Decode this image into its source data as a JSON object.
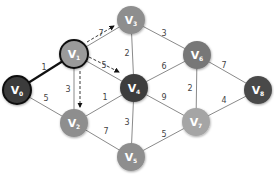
{
  "graph": {
    "nodes": [
      {
        "id": "V0",
        "label": "V",
        "sub": "0",
        "x": 17,
        "y": 90,
        "color": "#3a3a3a",
        "highlight": true
      },
      {
        "id": "V1",
        "label": "V",
        "sub": "1",
        "x": 74,
        "y": 54,
        "color": "#9a9a9a",
        "highlight": true
      },
      {
        "id": "V2",
        "label": "V",
        "sub": "2",
        "x": 74,
        "y": 123,
        "color": "#8e8e8e",
        "highlight": false
      },
      {
        "id": "V3",
        "label": "V",
        "sub": "3",
        "x": 131,
        "y": 20,
        "color": "#8e8e8e",
        "highlight": false
      },
      {
        "id": "V4",
        "label": "V",
        "sub": "4",
        "x": 134,
        "y": 88,
        "color": "#3e3e3e",
        "highlight": false
      },
      {
        "id": "V5",
        "label": "V",
        "sub": "5",
        "x": 131,
        "y": 157,
        "color": "#8e8e8e",
        "highlight": false
      },
      {
        "id": "V6",
        "label": "V",
        "sub": "6",
        "x": 197,
        "y": 55,
        "color": "#777777",
        "highlight": false
      },
      {
        "id": "V7",
        "label": "V",
        "sub": "7",
        "x": 196,
        "y": 122,
        "color": "#a5a5a5",
        "highlight": false
      },
      {
        "id": "V8",
        "label": "V",
        "sub": "8",
        "x": 258,
        "y": 90,
        "color": "#4a4a4a",
        "highlight": false
      }
    ],
    "edges": [
      {
        "from": "V0",
        "to": "V1",
        "weight": "1",
        "bold": true,
        "lx": 44,
        "ly": 70
      },
      {
        "from": "V0",
        "to": "V2",
        "weight": "5",
        "bold": false,
        "lx": 46,
        "ly": 101
      },
      {
        "from": "V1",
        "to": "V3",
        "weight": "7",
        "bold": false,
        "lx": 101,
        "ly": 36
      },
      {
        "from": "V1",
        "to": "V4",
        "weight": "5",
        "bold": false,
        "lx": 104,
        "ly": 68
      },
      {
        "from": "V1",
        "to": "V2",
        "weight": "3",
        "bold": false,
        "lx": 68,
        "ly": 92
      },
      {
        "from": "V2",
        "to": "V4",
        "weight": "1",
        "bold": false,
        "lx": 105,
        "ly": 100
      },
      {
        "from": "V2",
        "to": "V5",
        "weight": "7",
        "bold": false,
        "lx": 106,
        "ly": 134
      },
      {
        "from": "V3",
        "to": "V4",
        "weight": "2",
        "bold": false,
        "lx": 127,
        "ly": 56
      },
      {
        "from": "V3",
        "to": "V6",
        "weight": "3",
        "bold": false,
        "lx": 164,
        "ly": 36
      },
      {
        "from": "V4",
        "to": "V6",
        "weight": "6",
        "bold": false,
        "lx": 164,
        "ly": 69
      },
      {
        "from": "V4",
        "to": "V7",
        "weight": "9",
        "bold": false,
        "lx": 164,
        "ly": 100
      },
      {
        "from": "V4",
        "to": "V5",
        "weight": "3",
        "bold": false,
        "lx": 127,
        "ly": 125
      },
      {
        "from": "V5",
        "to": "V7",
        "weight": "5",
        "bold": false,
        "lx": 164,
        "ly": 137
      },
      {
        "from": "V6",
        "to": "V7",
        "weight": "2",
        "bold": false,
        "lx": 190,
        "ly": 91
      },
      {
        "from": "V6",
        "to": "V8",
        "weight": "7",
        "bold": false,
        "lx": 224,
        "ly": 68
      },
      {
        "from": "V7",
        "to": "V8",
        "weight": "4",
        "bold": false,
        "lx": 224,
        "ly": 103
      }
    ],
    "dashed_arrows": [
      {
        "from": "V1",
        "to": "V3",
        "x1": 87,
        "y1": 42,
        "x2": 114,
        "y2": 26
      },
      {
        "from": "V1",
        "to": "V4",
        "x1": 89,
        "y1": 57,
        "x2": 119,
        "y2": 72
      },
      {
        "from": "V1",
        "to": "V2",
        "x1": 80,
        "y1": 71,
        "x2": 80,
        "y2": 107
      }
    ]
  }
}
